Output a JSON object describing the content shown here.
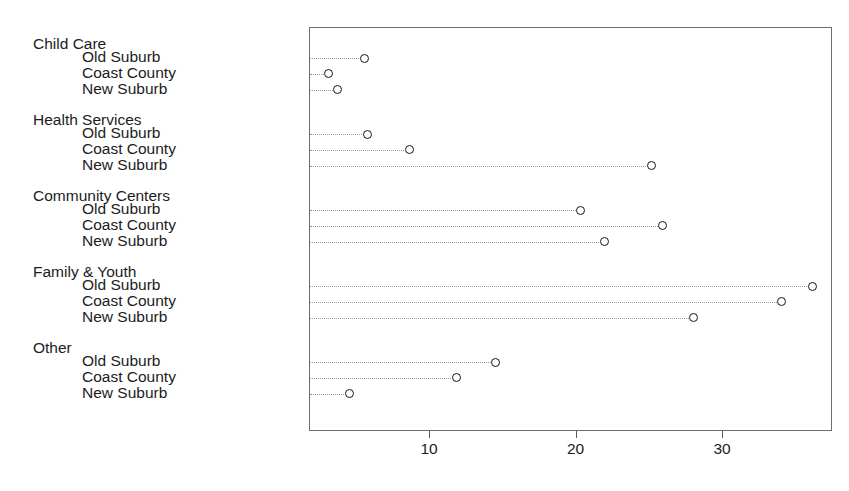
{
  "chart_data": {
    "type": "scatter",
    "subtype": "cleveland-dot-plot",
    "title": "",
    "xlabel": "",
    "ylabel": "",
    "xlim": [
      0,
      37.5
    ],
    "xticks": [
      10,
      20,
      30
    ],
    "xtick_labels": [
      "10",
      "20",
      "30"
    ],
    "grid": false,
    "leader_lines": true,
    "marker": "open-circle",
    "legend": "none",
    "group_label_names": [
      "Child Care",
      "Health Services",
      "Community Centers",
      "Family & Youth",
      "Other"
    ],
    "row_label_names": [
      "Old Suburb",
      "Coast County",
      "New Suburb"
    ],
    "groups": [
      {
        "name": "Child Care",
        "rows": [
          {
            "label": "Old Suburb",
            "value": 5.5
          },
          {
            "label": "Coast County",
            "value": 3.1
          },
          {
            "label": "New Suburb",
            "value": 3.7
          }
        ]
      },
      {
        "name": "Health Services",
        "rows": [
          {
            "label": "Old Suburb",
            "value": 5.7
          },
          {
            "label": "Coast County",
            "value": 8.6
          },
          {
            "label": "New Suburb",
            "value": 25.1
          }
        ]
      },
      {
        "name": "Community Centers",
        "rows": [
          {
            "label": "Old Suburb",
            "value": 20.3
          },
          {
            "label": "Coast County",
            "value": 25.9
          },
          {
            "label": "New Suburb",
            "value": 21.9
          }
        ]
      },
      {
        "name": "Family & Youth",
        "rows": [
          {
            "label": "Old Suburb",
            "value": 36.1
          },
          {
            "label": "Coast County",
            "value": 34.0
          },
          {
            "label": "New Suburb",
            "value": 28.0
          }
        ]
      },
      {
        "name": "Other",
        "rows": [
          {
            "label": "Old Suburb",
            "value": 14.5
          },
          {
            "label": "Coast County",
            "value": 11.8
          },
          {
            "label": "New Suburb",
            "value": 4.5
          }
        ]
      }
    ],
    "colors": {
      "marker_stroke": "#141414",
      "leader_line": "#9a9a9a",
      "frame": "#6e6e6e",
      "text": "#1c1c1c",
      "background": "#ffffff"
    }
  }
}
